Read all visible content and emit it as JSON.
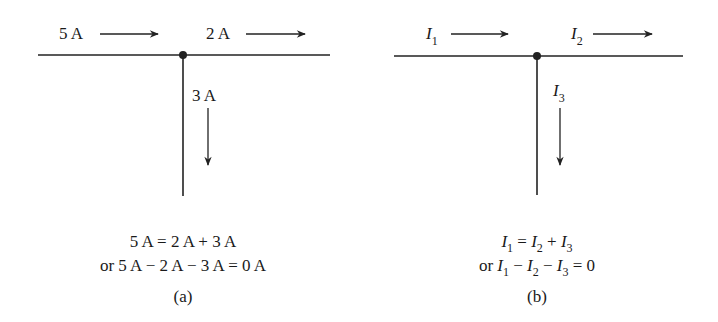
{
  "panels": [
    {
      "id": "a",
      "currents": [
        {
          "label": "5 A",
          "direction": "right"
        },
        {
          "label": "2 A",
          "direction": "right"
        },
        {
          "label": "3 A",
          "direction": "down"
        }
      ],
      "equation_line1": "5 A = 2 A + 3 A",
      "equation_line2": "or 5 A − 2 A − 3 A = 0 A",
      "caption": "(a)"
    },
    {
      "id": "b",
      "currents": [
        {
          "symbol": "I",
          "subscript": "1",
          "direction": "right"
        },
        {
          "symbol": "I",
          "subscript": "2",
          "direction": "right"
        },
        {
          "symbol": "I",
          "subscript": "3",
          "direction": "down"
        }
      ],
      "equation_line1": {
        "parts": [
          "I",
          "1",
          " = ",
          "I",
          "2",
          " + ",
          "I",
          "3"
        ]
      },
      "equation_line2": {
        "prefix": "or ",
        "parts": [
          "I",
          "1",
          " − ",
          "I",
          "2",
          " − ",
          "I",
          "3",
          " = 0"
        ]
      },
      "caption": "(b)"
    }
  ]
}
